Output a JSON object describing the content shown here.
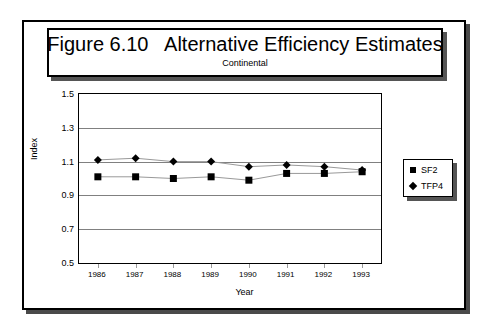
{
  "figure": {
    "title_main": "Figure 6.10   Alternative Efficiency Estimates",
    "subtitle": "Continental"
  },
  "legend": {
    "items": [
      {
        "label": "SF2",
        "marker": "square-marker"
      },
      {
        "label": "TFP4",
        "marker": "diamond-marker"
      }
    ]
  },
  "chart_data": {
    "type": "line",
    "title": "Figure 6.10   Alternative Efficiency Estimates",
    "subtitle": "Continental",
    "xlabel": "Year",
    "ylabel": "Index",
    "categories": [
      "1986",
      "1987",
      "1988",
      "1989",
      "1990",
      "1991",
      "1992",
      "1993"
    ],
    "x": [
      1986,
      1987,
      1988,
      1989,
      1990,
      1991,
      1992,
      1993
    ],
    "ylim": [
      0.5,
      1.5
    ],
    "yticks": [
      "0.5",
      "0.7",
      "0.9",
      "1.1",
      "1.3",
      "1.5"
    ],
    "ytick_values": [
      0.5,
      0.7,
      0.9,
      1.1,
      1.3,
      1.5
    ],
    "grid": true,
    "legend_position": "right",
    "series": [
      {
        "name": "SF2",
        "marker": "square-marker",
        "values": [
          1.01,
          1.01,
          1.0,
          1.01,
          0.99,
          1.03,
          1.03,
          1.04
        ]
      },
      {
        "name": "TFP4",
        "marker": "diamond-marker",
        "values": [
          1.11,
          1.12,
          1.1,
          1.1,
          1.07,
          1.08,
          1.07,
          1.05
        ]
      }
    ]
  },
  "colors": {
    "frame": "#000000",
    "gridline": "#808080",
    "series_line": "#999999",
    "marker": "#000000",
    "shadow": "#555555"
  }
}
